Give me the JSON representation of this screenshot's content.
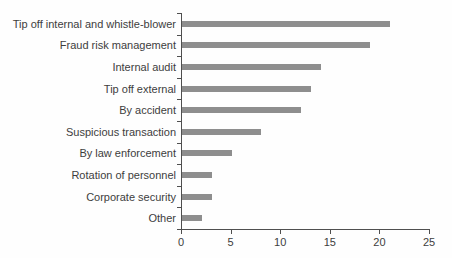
{
  "chart_data": {
    "type": "bar",
    "orientation": "horizontal",
    "title": "",
    "xlabel": "",
    "ylabel": "",
    "categories": [
      "Tip off internal and whistle-blower",
      "Fraud risk management",
      "Internal audit",
      "Tip off external",
      "By accident",
      "Suspicious transaction",
      "By law enforcement",
      "Rotation of personnel",
      "Corporate security",
      "Other"
    ],
    "values": [
      21,
      19,
      14,
      13,
      12,
      8,
      5,
      3,
      3,
      2
    ],
    "xlim": [
      0,
      25
    ],
    "x_ticks": [
      0,
      5,
      10,
      15,
      20,
      25
    ],
    "grid": false,
    "legend": false,
    "bar_color": "#8e8e8e",
    "axis_color": "#4f4f4f",
    "text_color": "#3d3d3d"
  }
}
